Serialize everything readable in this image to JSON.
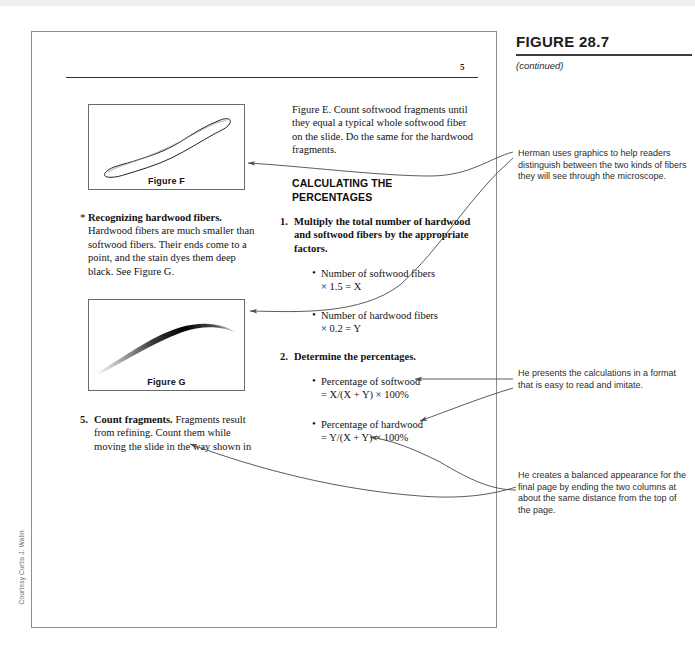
{
  "figure_label": {
    "title": "FIGURE 28.7",
    "continued": "(continued)"
  },
  "book_page": {
    "page_number": "5",
    "figure_f": {
      "caption": "Figure F",
      "art": "softwood-fiber-drawing"
    },
    "figure_g": {
      "caption": "Figure G",
      "art": "hardwood-fiber-drawing"
    },
    "hardwood_note": {
      "marker": "*",
      "run_in": "Recognizing hardwood fibers.",
      "body": " Hardwood fibers are much smaller than softwood fibers. Their ends come to a point, and the stain dyes them deep black. See Figure G."
    },
    "count_fragments": {
      "marker": "5.",
      "run_in": "Count fragments.",
      "body": " Fragments result from refining.  Count them while moving the slide in the way shown in"
    },
    "figure_e_text": "Figure E. Count softwood fragments until they equal a typical whole softwood fiber on the slide.  Do the same for the hardwood fragments.",
    "section_heading": "CALCULATING THE PERCENTAGES",
    "step_1": {
      "marker": "1.",
      "text": "Multiply the total number of hardwood and softwood fibers by the appropriate factors."
    },
    "step_2": {
      "marker": "2.",
      "text": "Determine the percentages."
    },
    "bullets": [
      {
        "line1": "Number of softwood fibers",
        "line2": "× 1.5 = X"
      },
      {
        "line1": "Number of hardwood fibers",
        "line2": "× 0.2 = Y"
      },
      {
        "line1": "Percentage of softwood",
        "line2": "= X/(X + Y) × 100%"
      },
      {
        "line1": "Percentage of hardwood",
        "line2": "= Y/(X + Y) × 100%"
      }
    ]
  },
  "annotations": [
    "Herman uses graphics to help readers distinguish between the two kinds of fibers they will see through the microscope.",
    "He presents the calculations in a format that is easy to read and imitate.",
    "He creates a balanced appearance for the final page by ending the two columns at about the same distance from the top of the page."
  ],
  "credit": "Courtesy Curtis J. Walin",
  "colors": {
    "frame": "#8d8d8d",
    "rule": "#2f2f2f",
    "text": "#121212",
    "annotation_text": "#2d2d2d",
    "arrow": "#4a4a4a",
    "top_edge": "#efefef"
  }
}
